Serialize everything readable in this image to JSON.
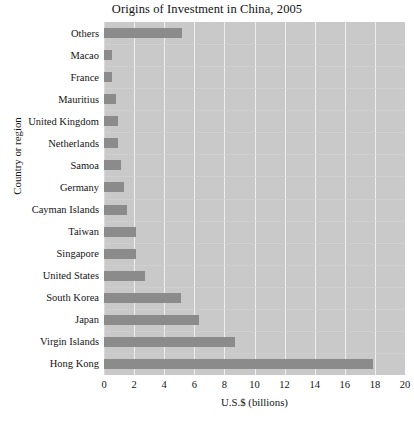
{
  "chart_data": {
    "type": "bar",
    "orientation": "horizontal",
    "title": "Origins of Investment in China, 2005",
    "xlabel": "U.S.$ (billions)",
    "ylabel": "Country or region",
    "categories": [
      "Others",
      "Macao",
      "France",
      "Mauritius",
      "United Kingdom",
      "Netherlands",
      "Samoa",
      "Germany",
      "Cayman Islands",
      "Taiwan",
      "Singapore",
      "United States",
      "South Korea",
      "Japan",
      "Virgin Islands",
      "Hong Kong"
    ],
    "values": [
      5.2,
      0.5,
      0.5,
      0.8,
      0.9,
      0.9,
      1.1,
      1.3,
      1.5,
      2.1,
      2.1,
      2.7,
      5.1,
      6.3,
      8.7,
      17.9
    ],
    "xlim": [
      0,
      20
    ],
    "xticks": [
      0,
      2,
      4,
      6,
      8,
      10,
      12,
      14,
      16,
      18,
      20
    ],
    "xtick_labels": [
      "0",
      "2",
      "4",
      "6",
      "8",
      "10",
      "12",
      "14",
      "16",
      "18",
      "20"
    ],
    "grid": true,
    "legend": false,
    "colors": {
      "bar": "#8b8b8b",
      "plot_background": "#c9c9c9",
      "gridline": "#efefef",
      "figure_background": "#ffffff",
      "text": "#141414"
    }
  }
}
